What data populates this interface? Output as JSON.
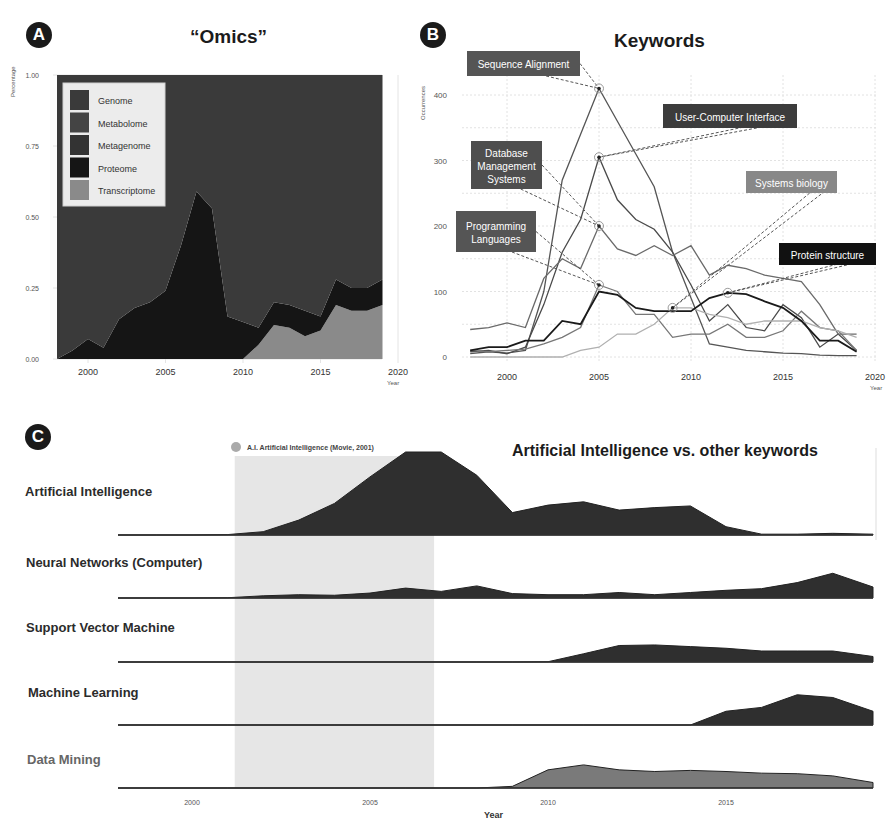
{
  "panels": {
    "A": {
      "badge": "A",
      "title": "“Omics”"
    },
    "B": {
      "badge": "B",
      "title": "Keywords"
    },
    "C": {
      "badge": "C",
      "title": "Artificial Intelligence vs. other keywords",
      "annotation": "A.I. Artificial Intelligence (Movie, 2001)"
    }
  },
  "chart_data": [
    {
      "id": "A",
      "type": "area",
      "stacked": true,
      "title": "“Omics”",
      "xlabel": "Year",
      "ylabel": "Percentage",
      "xlim": [
        1998,
        2020
      ],
      "ylim": [
        0,
        1
      ],
      "xticks": [
        2000,
        2005,
        2010,
        2015,
        2020
      ],
      "yticks": [
        "0.00",
        "0.25",
        "0.50",
        "0.75",
        "1.00"
      ],
      "grid": true,
      "legend": {
        "position": "top-left inside",
        "entries": [
          "Genome",
          "Metabolome",
          "Metagenome",
          "Proteome",
          "Transcriptome"
        ]
      },
      "colors": {
        "Genome": "#3a3a3a",
        "Metabolome": "#444444",
        "Metagenome": "#333333",
        "Proteome": "#151515",
        "Transcriptome": "#8a8a8a"
      },
      "x": [
        1998,
        1999,
        2000,
        2001,
        2002,
        2003,
        2004,
        2005,
        2006,
        2007,
        2008,
        2009,
        2010,
        2011,
        2012,
        2013,
        2014,
        2015,
        2016,
        2017,
        2018,
        2019
      ],
      "series": [
        {
          "name": "Transcriptome",
          "values": [
            0,
            0,
            0,
            0,
            0,
            0,
            0,
            0,
            0,
            0,
            0,
            0,
            0,
            0.05,
            0.12,
            0.11,
            0.08,
            0.1,
            0.19,
            0.17,
            0.17,
            0.19
          ]
        },
        {
          "name": "Proteome",
          "values": [
            0,
            0.03,
            0.07,
            0.04,
            0.14,
            0.18,
            0.2,
            0.24,
            0.4,
            0.59,
            0.53,
            0.15,
            0.13,
            0.06,
            0.08,
            0.08,
            0.09,
            0.05,
            0.09,
            0.08,
            0.08,
            0.09
          ]
        },
        {
          "name": "Metagenome",
          "values": [
            0,
            0,
            0,
            0,
            0,
            0,
            0,
            0,
            0,
            0,
            0,
            0,
            0,
            0,
            0,
            0,
            0,
            0,
            0,
            0,
            0,
            0
          ]
        },
        {
          "name": "Metabolome",
          "values": [
            0,
            0,
            0,
            0,
            0,
            0,
            0,
            0,
            0,
            0,
            0,
            0,
            0,
            0,
            0,
            0,
            0,
            0,
            0,
            0,
            0,
            0
          ]
        },
        {
          "name": "Genome",
          "values": [
            1,
            0.97,
            0.93,
            0.96,
            0.86,
            0.82,
            0.8,
            0.76,
            0.6,
            0.41,
            0.47,
            0.85,
            0.87,
            0.89,
            0.8,
            0.81,
            0.83,
            0.85,
            0.72,
            0.75,
            0.75,
            0.72
          ]
        }
      ]
    },
    {
      "id": "B",
      "type": "line",
      "title": "Keywords",
      "xlabel": "Year",
      "ylabel": "Occurrences",
      "xlim": [
        1998,
        2020
      ],
      "ylim": [
        0,
        430
      ],
      "xticks": [
        2000,
        2005,
        2010,
        2015,
        2020
      ],
      "yticks": [
        0,
        100,
        200,
        300,
        400
      ],
      "grid": true,
      "x": [
        1998,
        1999,
        2000,
        2001,
        2002,
        2003,
        2004,
        2005,
        2006,
        2007,
        2008,
        2009,
        2010,
        2011,
        2012,
        2013,
        2014,
        2015,
        2016,
        2017,
        2018,
        2019
      ],
      "series": [
        {
          "name": "Sequence Alignment",
          "color": "#555555",
          "values": [
            5,
            8,
            6,
            10,
            100,
            270,
            340,
            410,
            360,
            310,
            260,
            160,
            90,
            20,
            15,
            10,
            8,
            6,
            5,
            3,
            2,
            2
          ]
        },
        {
          "name": "User-Computer Interface",
          "color": "#4a4a4a",
          "values": [
            8,
            10,
            5,
            15,
            80,
            160,
            210,
            305,
            240,
            210,
            195,
            160,
            110,
            55,
            80,
            45,
            40,
            80,
            60,
            15,
            35,
            10
          ]
        },
        {
          "name": "Database Management Systems",
          "color": "#6a6a6a",
          "values": [
            42,
            45,
            52,
            45,
            120,
            150,
            135,
            200,
            165,
            155,
            170,
            155,
            170,
            125,
            140,
            135,
            125,
            120,
            115,
            80,
            35,
            35
          ]
        },
        {
          "name": "Programming Languages",
          "color": "#777777",
          "values": [
            10,
            8,
            10,
            12,
            20,
            30,
            45,
            110,
            100,
            65,
            65,
            30,
            35,
            35,
            50,
            30,
            30,
            40,
            70,
            45,
            40,
            10
          ]
        },
        {
          "name": "Systems biology",
          "color": "#b0b0b0",
          "values": [
            0,
            0,
            0,
            0,
            0,
            0,
            10,
            15,
            35,
            35,
            50,
            75,
            75,
            65,
            60,
            50,
            55,
            55,
            55,
            45,
            40,
            30
          ]
        },
        {
          "name": "Protein structure",
          "color": "#1a1a1a",
          "values": [
            10,
            15,
            15,
            25,
            25,
            55,
            50,
            100,
            95,
            75,
            70,
            70,
            70,
            90,
            98,
            96,
            85,
            75,
            55,
            25,
            25,
            8
          ]
        }
      ],
      "annotations": [
        {
          "label": "Sequence Alignment",
          "year": 2005,
          "value": 410,
          "box_color": "#555555"
        },
        {
          "label": "User-Computer Interface",
          "year": 2005,
          "value": 305,
          "box_color": "#3c3c3c"
        },
        {
          "label": "Database Management Systems",
          "year": 2005,
          "value": 200,
          "box_color": "#4e4e4e"
        },
        {
          "label": "Programming Languages",
          "year": 2005,
          "value": 110,
          "box_color": "#555555"
        },
        {
          "label": "Systems biology",
          "year": 2009,
          "value": 75,
          "box_color": "#888888"
        },
        {
          "label": "Protein structure",
          "year": 2012,
          "value": 98,
          "box_color": "#111111"
        }
      ]
    },
    {
      "id": "C",
      "type": "area",
      "layout": "ridgeline",
      "title": "Artificial Intelligence vs. other keywords",
      "xlabel": "Year",
      "xlim": [
        1998,
        2019
      ],
      "xticks": [
        2000,
        2005,
        2010,
        2015
      ],
      "highlight": {
        "label": "A.I. Artificial Intelligence (Movie, 2001)",
        "from": 2001.2,
        "to": 2006.8,
        "color": "#e6e6e6"
      },
      "x": [
        1998,
        1999,
        2000,
        2001,
        2002,
        2003,
        2004,
        2005,
        2006,
        2007,
        2008,
        2009,
        2010,
        2011,
        2012,
        2013,
        2014,
        2015,
        2016,
        2017,
        2018,
        2019
      ],
      "series": [
        {
          "name": "Artificial Intelligence",
          "color": "#2f2f2f",
          "values": [
            0,
            0,
            0,
            0.5,
            4,
            18,
            38,
            70,
            100,
            100,
            72,
            27,
            36,
            40,
            30,
            33,
            35,
            10,
            1,
            1,
            2,
            1
          ]
        },
        {
          "name": "Neural Networks (Computer)",
          "color": "#2f2f2f",
          "values": [
            0,
            0,
            0,
            0.5,
            4,
            6,
            5,
            9,
            18,
            12,
            22,
            8,
            6,
            6,
            10,
            6,
            10,
            14,
            17,
            28,
            45,
            20
          ]
        },
        {
          "name": "Support Vector Machine",
          "color": "#2f2f2f",
          "values": [
            0,
            0,
            0,
            0,
            0,
            0,
            0,
            0,
            0,
            0,
            0,
            0,
            0.5,
            15,
            30,
            31,
            28,
            25,
            20,
            20,
            20,
            10
          ]
        },
        {
          "name": "Machine Learning",
          "color": "#2f2f2f",
          "values": [
            0,
            0,
            0,
            0,
            0,
            0,
            0,
            0,
            0,
            0,
            0,
            0,
            0,
            0,
            0,
            0,
            0,
            25,
            32,
            55,
            50,
            25
          ]
        },
        {
          "name": "Data Mining",
          "color": "#7a7a7a",
          "values": [
            0,
            0,
            0,
            0,
            0,
            0,
            0,
            0,
            0,
            0,
            0,
            3,
            33,
            42,
            33,
            30,
            32,
            30,
            27,
            26,
            22,
            10
          ]
        }
      ]
    }
  ]
}
